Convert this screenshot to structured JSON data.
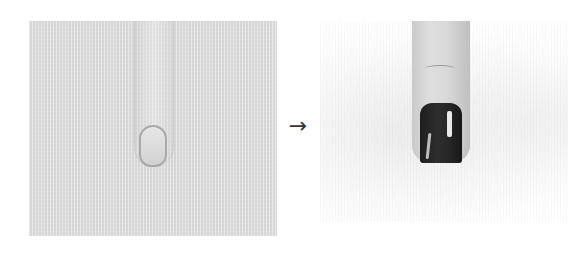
{
  "figure": {
    "before_panel": {
      "description": "Unpolished fingertip against a gray textured background"
    },
    "transition": {
      "arrow_glyph": "→"
    },
    "after_panel": {
      "description": "Fingertip with dark, glossy polished nail against a white background"
    }
  },
  "colors": {
    "before_background": "#dcdcdc",
    "after_background": "#ffffff",
    "nail_polish": "#222222",
    "arrow": "#333333"
  }
}
